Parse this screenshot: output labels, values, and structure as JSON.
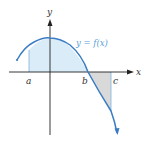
{
  "diagram": {
    "axes": {
      "x_label": "x",
      "y_label": "y"
    },
    "curve_label": "y = f(x)",
    "points": {
      "a": "a",
      "b": "b",
      "c": "c"
    },
    "colors": {
      "curve": "#3a7cc3",
      "positive_fill": "#d9ecf8",
      "negative_fill": "#d9d9d9",
      "axis": "#222222",
      "label": "#333333",
      "curve_label": "#5aa0d8"
    }
  }
}
